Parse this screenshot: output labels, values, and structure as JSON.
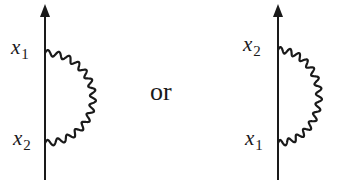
{
  "diagram": {
    "left": {
      "top_label": {
        "var": "x",
        "sub": "1"
      },
      "bottom_label": {
        "var": "x",
        "sub": "2"
      }
    },
    "connector": "or",
    "right": {
      "top_label": {
        "var": "x",
        "sub": "2"
      },
      "bottom_label": {
        "var": "x",
        "sub": "1"
      }
    },
    "colors": {
      "stroke": "#1a1a1a",
      "background": "#ffffff"
    }
  }
}
